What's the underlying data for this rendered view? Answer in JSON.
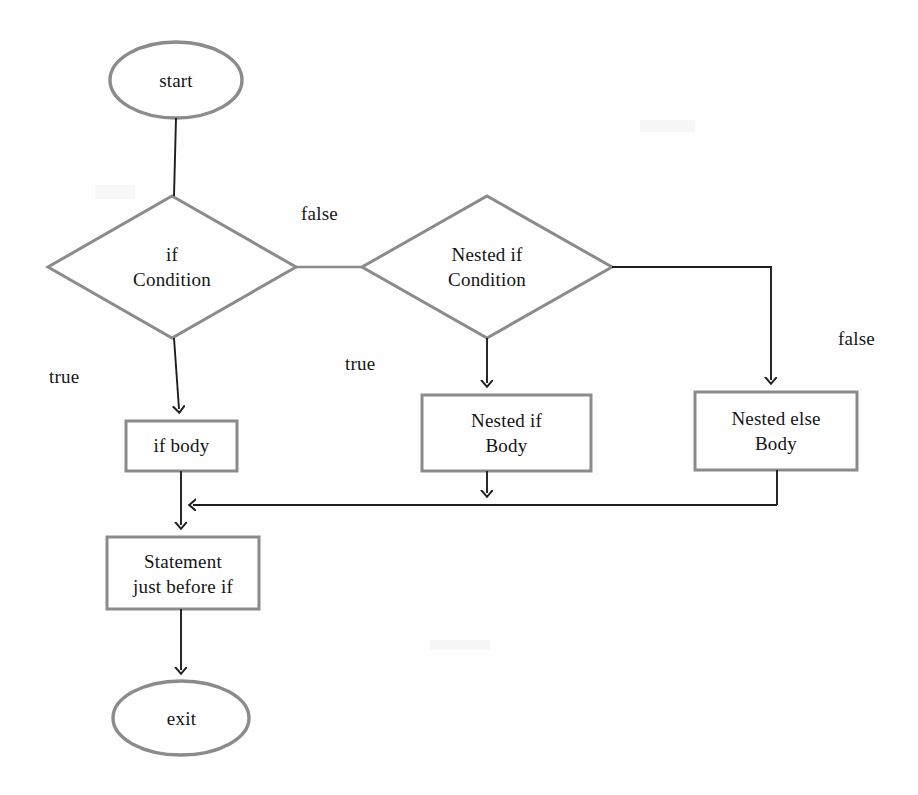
{
  "diagram": {
    "type": "flowchart",
    "style": {
      "shape_stroke": "#8b8b8b",
      "connector_stroke": "#1d1d1d",
      "text_color": "#141414",
      "background": "#fefefe",
      "shape_stroke_width": 3,
      "connector_stroke_width": 2
    },
    "nodes": [
      {
        "id": "start",
        "shape": "ellipse",
        "label": "start",
        "x": 110,
        "y": 42,
        "w": 132,
        "h": 76
      },
      {
        "id": "if-condition",
        "shape": "diamond",
        "label": "if\nCondition",
        "x": 48,
        "y": 196,
        "w": 248,
        "h": 142
      },
      {
        "id": "nested-if-condition",
        "shape": "diamond",
        "label": "Nested if\nCondition",
        "x": 362,
        "y": 196,
        "w": 250,
        "h": 142
      },
      {
        "id": "if-body",
        "shape": "rect",
        "label": "if body",
        "x": 126,
        "y": 421,
        "w": 111,
        "h": 50
      },
      {
        "id": "nested-if-body",
        "shape": "rect",
        "label": "Nested if\nBody",
        "x": 422,
        "y": 395,
        "w": 169,
        "h": 76
      },
      {
        "id": "nested-else-body",
        "shape": "rect",
        "label": "Nested else\nBody",
        "x": 695,
        "y": 392,
        "w": 162,
        "h": 78
      },
      {
        "id": "statement-before-if",
        "shape": "rect",
        "label": "Statement\njust before if",
        "x": 107,
        "y": 537,
        "w": 152,
        "h": 72
      },
      {
        "id": "exit",
        "shape": "ellipse",
        "label": "exit",
        "x": 113,
        "y": 681,
        "w": 137,
        "h": 75
      }
    ],
    "edge_labels": [
      {
        "id": "false-if",
        "text": "false",
        "x": 301,
        "y": 203
      },
      {
        "id": "true-if",
        "text": "true",
        "x": 49,
        "y": 366
      },
      {
        "id": "true-nested-if",
        "text": "true",
        "x": 345,
        "y": 353
      },
      {
        "id": "false-nested-if",
        "text": "false",
        "x": 838,
        "y": 328
      }
    ],
    "edges": [
      {
        "from": "start",
        "to": "if-condition",
        "label": ""
      },
      {
        "from": "if-condition",
        "to": "nested-if-condition",
        "label": "false"
      },
      {
        "from": "if-condition",
        "to": "if-body",
        "label": "true"
      },
      {
        "from": "nested-if-condition",
        "to": "nested-if-body",
        "label": "true"
      },
      {
        "from": "nested-if-condition",
        "to": "nested-else-body",
        "label": "false"
      },
      {
        "from": "if-body",
        "to": "statement-before-if",
        "label": ""
      },
      {
        "from": "nested-if-body",
        "to": "statement-before-if",
        "label": ""
      },
      {
        "from": "nested-else-body",
        "to": "statement-before-if",
        "label": ""
      },
      {
        "from": "statement-before-if",
        "to": "exit",
        "label": ""
      }
    ]
  }
}
